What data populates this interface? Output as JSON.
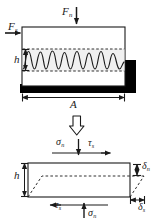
{
  "figure": {
    "colors": {
      "line": "#1a1a1a",
      "fill_band": "#f0f0f0",
      "solid_block": "#000000",
      "background": "#ffffff"
    },
    "upper_panel": {
      "name": "applied-load-panel",
      "description": "Rectangular joint specimen with asperity (wavy) interface band",
      "labels": {
        "normal_force": "F",
        "normal_force_sub": "n",
        "shear_force": "F",
        "shear_force_sub": "s",
        "height": "h",
        "area": "A"
      },
      "arrows": {
        "normal_force_direction": "down",
        "shear_force_direction": "right",
        "height_dimension": "double-vertical",
        "area_dimension": "double-horizontal"
      },
      "asperity_waves": 8
    },
    "transition": {
      "name": "transition-arrow",
      "direction": "down",
      "style": "hollow-outline"
    },
    "lower_panel": {
      "name": "stress-displacement-panel",
      "description": "Equivalent joint element with normal and shear stresses and displacements",
      "labels": {
        "normal_stress_top": "σ",
        "normal_stress_top_sub": "n",
        "shear_stress_top": "τ",
        "shear_stress_top_sub": "s",
        "shear_stress_bottom": "τ",
        "shear_stress_bottom_sub": "s",
        "normal_stress_bottom": "σ",
        "normal_stress_bottom_sub": "n",
        "height": "h",
        "normal_displacement": "δ",
        "normal_displacement_sub": "n",
        "shear_displacement": "δ",
        "shear_displacement_sub": "s"
      },
      "arrows": {
        "normal_stress_top_direction": "down",
        "shear_stress_top_direction": "right",
        "shear_stress_bottom_direction": "left",
        "normal_stress_bottom_direction": "up",
        "normal_displacement_dimension": "double-vertical",
        "shear_displacement_dimension": "double-horizontal"
      },
      "deformed_shape": "dashed-sheared-parallelogram"
    }
  }
}
